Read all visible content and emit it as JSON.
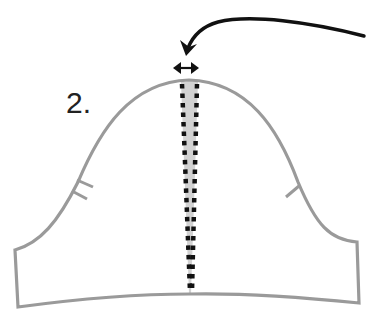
{
  "diagram": {
    "type": "sewing-pattern-sleeve",
    "step_label": "2.",
    "colors": {
      "outline": "#9a9a9a",
      "wedge_fill": "#d2d2d2",
      "dotted_line": "#111111",
      "arrow": "#111111",
      "label": "#222222",
      "background": "#ffffff"
    },
    "elements": [
      {
        "name": "sleeve-outline",
        "description": "Sleeve pattern piece with rounded cap"
      },
      {
        "name": "shaded-wedge",
        "description": "Gray wedge slashed from cap to hem"
      },
      {
        "name": "dotted-lines",
        "count": 2,
        "description": "Two dotted cut lines converging at hem"
      },
      {
        "name": "back-notch",
        "count": 2,
        "side": "left"
      },
      {
        "name": "front-notch",
        "count": 1,
        "side": "right"
      },
      {
        "name": "width-indicator",
        "description": "Double-headed arrow above cap showing spread"
      },
      {
        "name": "pointer-arrow",
        "description": "Curved arrow pointing at cap spread"
      }
    ]
  }
}
